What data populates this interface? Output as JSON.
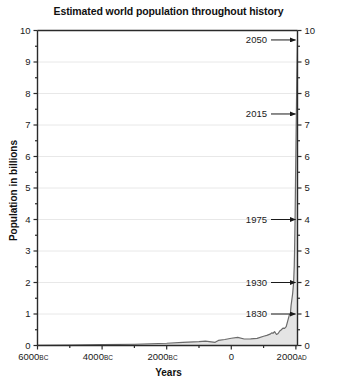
{
  "chart_data": {
    "type": "area",
    "title": "Estimated world population throughout history",
    "xlabel": "Years",
    "ylabel": "Population in billions",
    "xlim": [
      -6000,
      2050
    ],
    "ylim": [
      0,
      10
    ],
    "grid": true,
    "legend": "none",
    "x_ticks": [
      {
        "value": -6000,
        "label": "6000",
        "suffix": "BC"
      },
      {
        "value": -4000,
        "label": "4000",
        "suffix": "BC"
      },
      {
        "value": -2000,
        "label": "2000",
        "suffix": "BC"
      },
      {
        "value": 0,
        "label": "0",
        "suffix": ""
      },
      {
        "value": 2000,
        "label": "2000",
        "suffix": "AD"
      }
    ],
    "y_ticks": [
      {
        "value": 0,
        "label": "0"
      },
      {
        "value": 1,
        "label": "1"
      },
      {
        "value": 2,
        "label": "2"
      },
      {
        "value": 3,
        "label": "3"
      },
      {
        "value": 4,
        "label": "4"
      },
      {
        "value": 5,
        "label": "5"
      },
      {
        "value": 6,
        "label": "6"
      },
      {
        "value": 7,
        "label": "7"
      },
      {
        "value": 8,
        "label": "8"
      },
      {
        "value": 9,
        "label": "9"
      },
      {
        "value": 10,
        "label": "10"
      }
    ],
    "y_minor_step": 0.5,
    "x_minor_step": 1000,
    "series": [
      {
        "name": "World population",
        "x": [
          -6000,
          -5000,
          -4000,
          -3000,
          -2000,
          -1500,
          -1000,
          -800,
          -500,
          -400,
          -200,
          0,
          200,
          400,
          600,
          800,
          1000,
          1100,
          1200,
          1250,
          1300,
          1340,
          1400,
          1450,
          1500,
          1550,
          1600,
          1650,
          1700,
          1750,
          1800,
          1830,
          1850,
          1900,
          1930,
          1950,
          1960,
          1970,
          1975,
          1980,
          1990,
          2000,
          2010,
          2015,
          2020,
          2030,
          2040,
          2050
        ],
        "y": [
          0.007,
          0.015,
          0.025,
          0.04,
          0.072,
          0.1,
          0.12,
          0.14,
          0.1,
          0.162,
          0.19,
          0.23,
          0.257,
          0.206,
          0.208,
          0.224,
          0.295,
          0.32,
          0.36,
          0.4,
          0.396,
          0.44,
          0.35,
          0.38,
          0.461,
          0.5,
          0.554,
          0.545,
          0.6,
          0.79,
          0.978,
          1.0,
          1.262,
          1.65,
          2.0,
          2.536,
          3.03,
          3.7,
          4.0,
          4.43,
          5.32,
          6.14,
          6.96,
          7.35,
          7.79,
          8.55,
          9.2,
          9.7
        ]
      }
    ],
    "annotations": [
      {
        "label": "2050",
        "year": 2050,
        "value": 9.7
      },
      {
        "label": "2015",
        "year": 2015,
        "value": 7.35
      },
      {
        "label": "1975",
        "year": 1975,
        "value": 4.0
      },
      {
        "label": "1930",
        "year": 1930,
        "value": 2.0
      },
      {
        "label": "1830",
        "year": 1830,
        "value": 1.0
      }
    ],
    "colors": {
      "line": "#6b6b6b",
      "fill": "#e4e4e4",
      "grid": "#e8e8e8",
      "axis": "#2a2a2a",
      "text": "#1a1a1a"
    }
  }
}
